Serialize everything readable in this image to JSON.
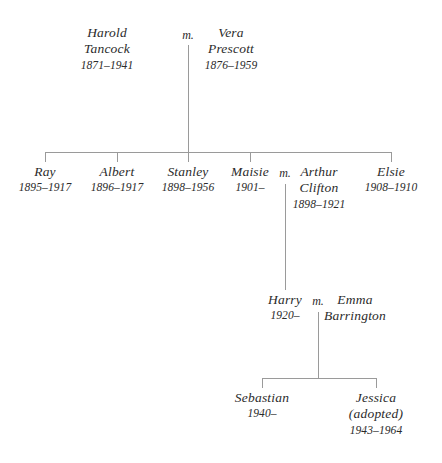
{
  "diagram": {
    "type": "family-tree",
    "marriage_symbol": "m.",
    "line_color": "#9a9a9a",
    "text_color": "#2b2b2b",
    "background_color": "#ffffff"
  },
  "generations": [
    {
      "id": "gen1",
      "people": [
        {
          "id": "harold",
          "name_line1": "Harold",
          "name_line2": "Tancock",
          "dates": "1871–1941"
        },
        {
          "id": "vera",
          "name_line1": "Vera",
          "name_line2": "Prescott",
          "dates": "1876–1959"
        }
      ],
      "marriage_symbol": "m."
    },
    {
      "id": "gen2",
      "people": [
        {
          "id": "ray",
          "name_line1": "Ray",
          "name_line2": "",
          "dates": "1895–1917"
        },
        {
          "id": "albert",
          "name_line1": "Albert",
          "name_line2": "",
          "dates": "1896–1917"
        },
        {
          "id": "stanley",
          "name_line1": "Stanley",
          "name_line2": "",
          "dates": "1898–1956"
        },
        {
          "id": "maisie",
          "name_line1": "Maisie",
          "name_line2": "",
          "dates": "1901–"
        },
        {
          "id": "arthur",
          "name_line1": "Arthur",
          "name_line2": "Clifton",
          "dates": "1898–1921"
        },
        {
          "id": "elsie",
          "name_line1": "Elsie",
          "name_line2": "",
          "dates": "1908–1910"
        }
      ],
      "marriage_symbol": "m."
    },
    {
      "id": "gen3",
      "people": [
        {
          "id": "harry",
          "name_line1": "Harry",
          "name_line2": "",
          "dates": "1920–"
        },
        {
          "id": "emma",
          "name_line1": "Emma",
          "name_line2": "Barrington",
          "dates": ""
        }
      ],
      "marriage_symbol": "m."
    },
    {
      "id": "gen4",
      "people": [
        {
          "id": "sebastian",
          "name_line1": "Sebastian",
          "name_line2": "",
          "dates": "1940–"
        },
        {
          "id": "jessica",
          "name_line1": "Jessica",
          "name_line2": "(adopted)",
          "dates": "1943–1964"
        }
      ]
    }
  ]
}
